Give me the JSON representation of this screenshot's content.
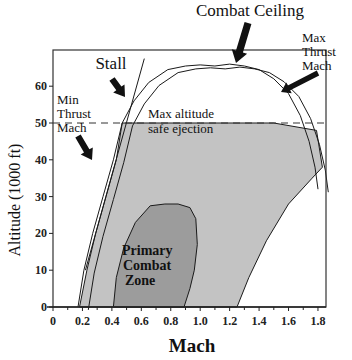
{
  "chart_data": {
    "type": "area",
    "title": "",
    "xlabel": "Mach",
    "ylabel": "Altitude (1000 ft)",
    "xlim": [
      0,
      1.9
    ],
    "ylim": [
      0,
      70
    ],
    "xticks": [
      0,
      0.2,
      0.4,
      0.6,
      0.8,
      1.0,
      1.2,
      1.4,
      1.6,
      1.8
    ],
    "xtick_labels": [
      "0",
      "0.2",
      "0.4",
      "0.6",
      "0.8",
      "1.0",
      "1.2",
      "1.4",
      "1.6",
      "1.8"
    ],
    "yticks": [
      0,
      10,
      20,
      30,
      40,
      50,
      60
    ],
    "ytick_labels": [
      "0",
      "10",
      "20",
      "30",
      "40",
      "50",
      "60"
    ],
    "grid": false,
    "series": [
      {
        "name": "Flight envelope (outer, inner line)",
        "kind": "double-line",
        "x": [
          0.17,
          0.21,
          0.27,
          0.34,
          0.41,
          0.47,
          0.55,
          0.65,
          0.78,
          0.9,
          1.0,
          1.1,
          1.2,
          1.3,
          1.4,
          1.5,
          1.6,
          1.68,
          1.74,
          1.78,
          1.8
        ],
        "y": [
          0,
          10,
          20,
          30,
          40,
          50,
          56,
          61,
          64.5,
          65.5,
          65.8,
          65.5,
          66,
          65.5,
          64.5,
          62,
          58,
          52,
          45,
          38,
          32
        ]
      },
      {
        "name": "Stall",
        "kind": "line",
        "x": [
          0.22,
          0.62
        ],
        "y": [
          10,
          67.5
        ]
      },
      {
        "name": "Safe ejection envelope",
        "kind": "filled-area",
        "color": "#c3c3c3",
        "x": [
          0.18,
          0.23,
          0.29,
          0.36,
          0.43,
          0.47,
          1.0,
          1.5,
          1.79,
          1.83,
          1.76,
          1.6,
          1.45,
          1.33,
          1.25
        ],
        "y": [
          0,
          10,
          20,
          30,
          40,
          50,
          50,
          50,
          48,
          38,
          35,
          28,
          18,
          8,
          0
        ]
      },
      {
        "name": "Primary Combat Zone",
        "kind": "filled-area",
        "color": "#9c9c9c",
        "x": [
          0.41,
          0.43,
          0.48,
          0.56,
          0.66,
          0.76,
          0.85,
          0.93,
          0.97,
          0.98,
          0.96,
          0.93,
          0.89
        ],
        "y": [
          0,
          8,
          16,
          23,
          27.5,
          28,
          28,
          27,
          24,
          17,
          10,
          5,
          0
        ]
      },
      {
        "name": "Max altitude safe ejection",
        "kind": "dashed-line",
        "x": [
          0,
          1.9
        ],
        "y": [
          50,
          50
        ]
      }
    ],
    "annotations": [
      {
        "text": "Combat Ceiling",
        "points_to": [
          1.38,
          66
        ]
      },
      {
        "text": "Stall",
        "points_to": [
          0.48,
          56
        ]
      },
      {
        "text": "Min Thrust Mach",
        "points_to": [
          0.35,
          38
        ]
      },
      {
        "text": "Max Thrust Mach",
        "points_to": [
          1.66,
          56
        ]
      },
      {
        "text": "Max altitude safe ejection"
      },
      {
        "text": "Primary Combat Zone"
      }
    ]
  },
  "labels": {
    "combat_ceiling": "Combat Ceiling",
    "stall": "Stall",
    "min_thrust": [
      "Min",
      "Thrust",
      "Mach"
    ],
    "max_thrust": [
      "Max",
      "Thrust",
      "Mach"
    ],
    "safe_ejection": [
      "Max altitude",
      "safe ejection"
    ],
    "primary_zone": [
      "Primary",
      "Combat",
      "Zone"
    ]
  },
  "colors": {
    "envelope_fill": "#c3c3c3",
    "zone_fill": "#9c9c9c",
    "line": "#1a1a1a",
    "frame": "#333333"
  }
}
